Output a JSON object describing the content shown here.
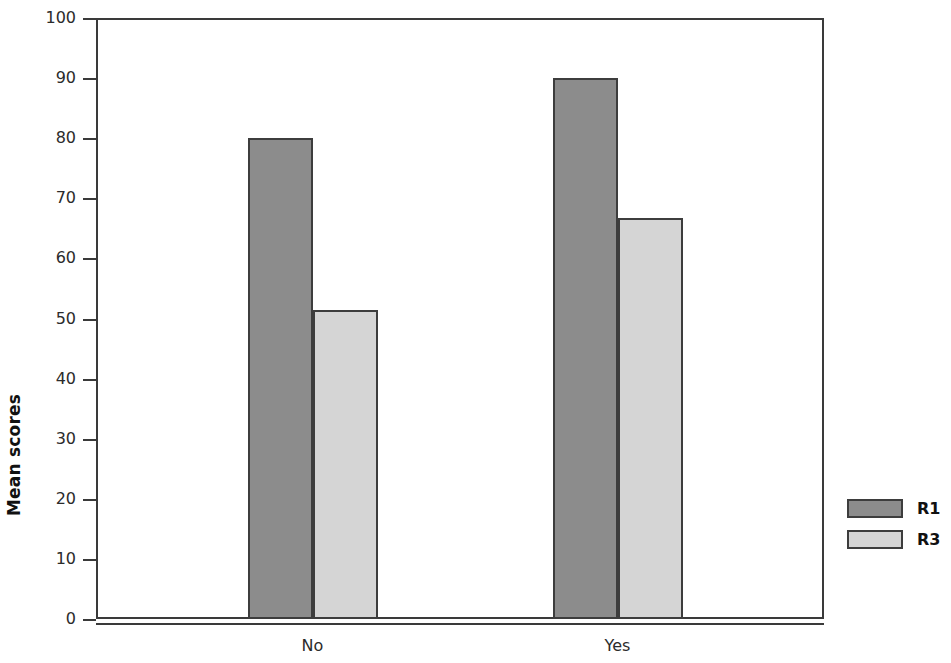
{
  "chart_data": {
    "type": "bar",
    "title": "",
    "subtitle": "",
    "xlabel": "",
    "ylabel": "Mean scores",
    "categories": [
      "No",
      "Yes"
    ],
    "series": [
      {
        "name": "R1",
        "values": [
          80,
          90
        ],
        "color": "#8c8c8c"
      },
      {
        "name": "R3",
        "values": [
          51.5,
          66.7
        ],
        "color": "#d5d5d5"
      }
    ],
    "ylim": [
      0,
      100
    ],
    "ytick_step": 10,
    "ytick_labels": [
      "0",
      "10",
      "20",
      "30",
      "40",
      "50",
      "60",
      "70",
      "80",
      "90",
      "100"
    ],
    "grid": false,
    "legend_position": "right",
    "bar_border_color": "#3d3d3d",
    "axis_color": "#3a3a3a",
    "background": "#ffffff"
  },
  "axis": {
    "y_title": "Mean scores"
  },
  "legend": {
    "entries": [
      {
        "label": "R1"
      },
      {
        "label": "R3"
      }
    ]
  }
}
